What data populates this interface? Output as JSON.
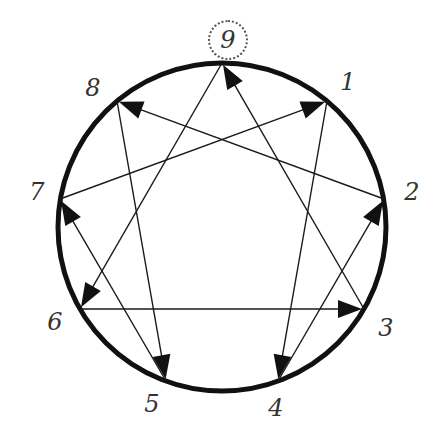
{
  "circle": {
    "cx": 222,
    "cy": 227,
    "r": 164,
    "stroke": "#111111",
    "stroke_width": 5
  },
  "highlighted_point": "9",
  "points": [
    {
      "id": "9",
      "label": "9",
      "x": 222,
      "y": 63,
      "label_x": 228,
      "label_y": 40
    },
    {
      "id": "1",
      "label": "1",
      "x": 327,
      "y": 101,
      "label_x": 348,
      "label_y": 82
    },
    {
      "id": "2",
      "label": "2",
      "x": 384,
      "y": 199,
      "label_x": 412,
      "label_y": 192
    },
    {
      "id": "3",
      "label": "3",
      "x": 364,
      "y": 309,
      "label_x": 386,
      "label_y": 328
    },
    {
      "id": "4",
      "label": "4",
      "x": 278,
      "y": 381,
      "label_x": 276,
      "label_y": 408
    },
    {
      "id": "5",
      "label": "5",
      "x": 166,
      "y": 381,
      "label_x": 152,
      "label_y": 404
    },
    {
      "id": "6",
      "label": "6",
      "x": 80,
      "y": 309,
      "label_x": 55,
      "label_y": 322
    },
    {
      "id": "7",
      "label": "7",
      "x": 60,
      "y": 199,
      "label_x": 37,
      "label_y": 192
    },
    {
      "id": "8",
      "label": "8",
      "x": 117,
      "y": 101,
      "label_x": 93,
      "label_y": 88
    }
  ],
  "arrows": [
    {
      "from": "3",
      "to": "9"
    },
    {
      "from": "9",
      "to": "6"
    },
    {
      "from": "6",
      "to": "3"
    },
    {
      "from": "1",
      "to": "4"
    },
    {
      "from": "4",
      "to": "2"
    },
    {
      "from": "2",
      "to": "8"
    },
    {
      "from": "8",
      "to": "5"
    },
    {
      "from": "5",
      "to": "7"
    },
    {
      "from": "7",
      "to": "1"
    }
  ],
  "line_color": "#1a1a1a",
  "arrowhead_color": "#111111"
}
